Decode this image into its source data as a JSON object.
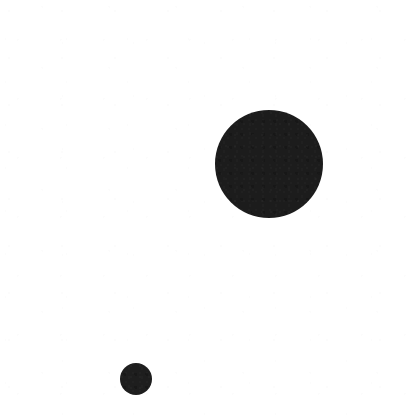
{
  "image": {
    "kind": "minimal-graphic",
    "description": "Two solid black circles on a plain white background",
    "width": 411,
    "height": 416,
    "background_color": "#ffffff",
    "ink_color": "#1c1c1c",
    "alt_text": "A large black disc in the upper right area and a much smaller black disc in the lower left area, on white."
  },
  "shapes": [
    {
      "name": "large-disc",
      "type": "circle",
      "center_x": 269,
      "center_y": 164,
      "diameter": 108,
      "radius": 54,
      "color": "#1c1c1c",
      "edge": "antialiased"
    },
    {
      "name": "small-disc",
      "type": "circle",
      "center_x": 136,
      "center_y": 379,
      "diameter": 32,
      "radius": 16,
      "color": "#1e1e1e",
      "edge": "antialiased"
    }
  ],
  "text": {
    "labels": [],
    "note": "No text, axes, legend, or UI chrome present in the image."
  }
}
